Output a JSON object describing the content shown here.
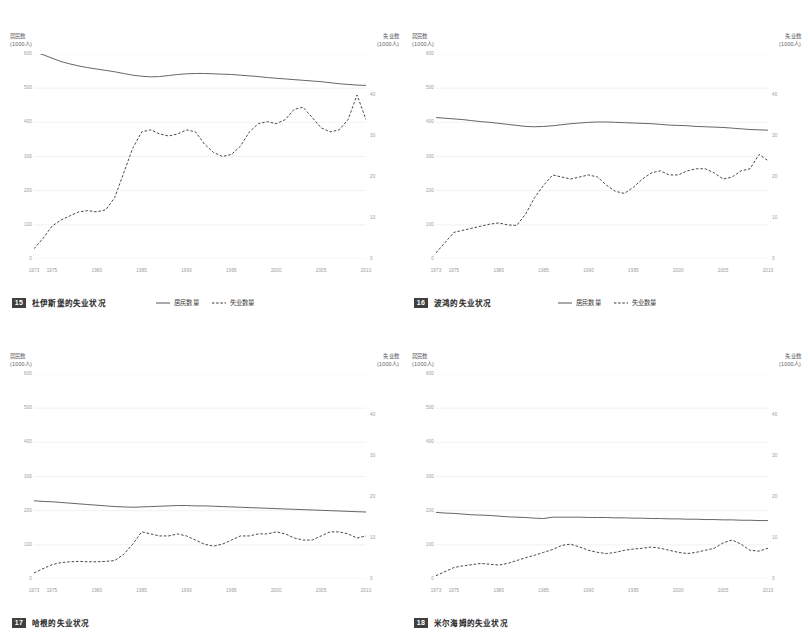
{
  "axes": {
    "left_title": "居民数",
    "left_unit": "(1000人)",
    "right_title": "失业数",
    "right_unit": "(1000人)",
    "left_ticks": [
      "600",
      "500",
      "400",
      "300",
      "200",
      "100",
      "0"
    ],
    "right_ticks": [
      "40",
      "30",
      "20",
      "10",
      "0"
    ],
    "x_ticks": [
      "1973",
      "1975",
      "1980",
      "1985",
      "1990",
      "1995",
      "2000",
      "2005",
      "2010"
    ]
  },
  "legend": {
    "items": [
      {
        "label": "居民数量",
        "style": "solid",
        "color": "#555555"
      },
      {
        "label": "失业数量",
        "style": "dashed",
        "color": "#333333"
      }
    ]
  },
  "colors": {
    "residents_line": "#555555",
    "unemployed_line": "#333333",
    "gridline": "#ececec",
    "tick_text": "#9a9a9a",
    "badge_bg": "#3f3f3f"
  },
  "panels": [
    {
      "number": "15",
      "title": "杜伊斯堡的失业状况"
    },
    {
      "number": "16",
      "title": "波鸿的失业状况"
    },
    {
      "number": "17",
      "title": "哈根的失业状况"
    },
    {
      "number": "18",
      "title": "米尔海姆的失业状况"
    }
  ],
  "chart_data": [
    {
      "type": "line",
      "title": "杜伊斯堡的失业状况",
      "number": "15",
      "xlabel": "",
      "ylabel": "居民数 (1000人)",
      "y2label": "失业数 (1000人)",
      "ylim": [
        0,
        600
      ],
      "y2lim": [
        0,
        50
      ],
      "xlim": [
        1973,
        2010
      ],
      "grid": true,
      "legend_position": "below-right",
      "x": [
        1973,
        1974,
        1975,
        1976,
        1977,
        1978,
        1979,
        1980,
        1981,
        1982,
        1983,
        1984,
        1985,
        1986,
        1987,
        1988,
        1989,
        1990,
        1991,
        1992,
        1993,
        1994,
        1995,
        1996,
        1997,
        1998,
        1999,
        2000,
        2001,
        2002,
        2003,
        2004,
        2005,
        2006,
        2007,
        2008,
        2009,
        2010
      ],
      "series": [
        {
          "name": "居民数量",
          "axis": "left",
          "style": "solid",
          "values": [
            607,
            598,
            588,
            578,
            571,
            565,
            560,
            556,
            552,
            548,
            543,
            538,
            535,
            533,
            534,
            537,
            540,
            542,
            543,
            543,
            542,
            541,
            540,
            538,
            536,
            534,
            531,
            529,
            527,
            525,
            523,
            521,
            519,
            516,
            513,
            511,
            509,
            508
          ]
        },
        {
          "name": "失业数量",
          "axis": "right",
          "style": "dashed",
          "values": [
            2.5,
            5,
            8,
            9.5,
            10.5,
            11.5,
            11.8,
            11.5,
            12,
            15,
            21,
            27,
            31,
            31.5,
            30.5,
            30,
            30.5,
            31.5,
            31,
            28,
            26,
            25,
            25.5,
            27.5,
            31,
            33,
            33.5,
            33,
            34,
            36.5,
            37,
            34.5,
            32,
            31,
            31.5,
            34,
            40,
            34,
            31,
            30,
            32,
            32
          ]
        }
      ]
    },
    {
      "type": "line",
      "title": "波鸿的失业状况",
      "number": "16",
      "xlabel": "",
      "ylabel": "居民数 (1000人)",
      "y2label": "失业数 (1000人)",
      "ylim": [
        0,
        600
      ],
      "y2lim": [
        0,
        50
      ],
      "xlim": [
        1973,
        2010
      ],
      "grid": true,
      "legend_position": "below-right",
      "x": [
        1973,
        1974,
        1975,
        1976,
        1977,
        1978,
        1979,
        1980,
        1981,
        1982,
        1983,
        1984,
        1985,
        1986,
        1987,
        1988,
        1989,
        1990,
        1991,
        1992,
        1993,
        1994,
        1995,
        1996,
        1997,
        1998,
        1999,
        2000,
        2001,
        2002,
        2003,
        2004,
        2005,
        2006,
        2007,
        2008,
        2009,
        2010
      ],
      "series": [
        {
          "name": "居民数量",
          "axis": "left",
          "style": "solid",
          "values": [
            414,
            412,
            410,
            408,
            405,
            402,
            400,
            397,
            394,
            391,
            388,
            387,
            388,
            390,
            393,
            396,
            398,
            400,
            401,
            401,
            400,
            399,
            398,
            397,
            396,
            394,
            392,
            391,
            390,
            388,
            387,
            386,
            385,
            383,
            381,
            379,
            378,
            377
          ]
        },
        {
          "name": "失业数量",
          "axis": "right",
          "style": "dashed",
          "values": [
            1.5,
            4,
            6.5,
            7,
            7.5,
            8,
            8.5,
            8.8,
            8.3,
            8.2,
            11,
            15,
            18,
            20.5,
            20,
            19.5,
            20,
            20.5,
            20,
            18,
            16.5,
            16,
            17.5,
            19.5,
            21,
            21.5,
            20.5,
            20.5,
            21.5,
            22,
            22,
            21,
            19.5,
            20,
            21.5,
            22,
            25.5,
            24,
            19,
            18.5,
            20.5,
            19
          ]
        }
      ]
    },
    {
      "type": "line",
      "title": "哈根的失业状况",
      "number": "17",
      "xlabel": "",
      "ylabel": "居民数 (1000人)",
      "y2label": "失业数 (1000人)",
      "ylim": [
        0,
        600
      ],
      "y2lim": [
        0,
        50
      ],
      "xlim": [
        1973,
        2010
      ],
      "grid": true,
      "legend_position": "none",
      "x": [
        1973,
        1974,
        1975,
        1976,
        1977,
        1978,
        1979,
        1980,
        1981,
        1982,
        1983,
        1984,
        1985,
        1986,
        1987,
        1988,
        1989,
        1990,
        1991,
        1992,
        1993,
        1994,
        1995,
        1996,
        1997,
        1998,
        1999,
        2000,
        2001,
        2002,
        2003,
        2004,
        2005,
        2006,
        2007,
        2008,
        2009,
        2010
      ],
      "series": [
        {
          "name": "居民数量",
          "axis": "left",
          "style": "solid",
          "values": [
            229,
            227,
            226,
            224,
            222,
            220,
            218,
            216,
            214,
            212,
            211,
            210,
            211,
            212,
            213,
            214,
            215,
            215,
            214,
            214,
            213,
            212,
            211,
            210,
            209,
            208,
            207,
            206,
            205,
            204,
            203,
            202,
            201,
            200,
            199,
            198,
            197,
            196
          ]
        },
        {
          "name": "失业数量",
          "axis": "right",
          "style": "dashed",
          "values": [
            1.5,
            2.5,
            3.5,
            4,
            4.2,
            4.3,
            4.2,
            4.2,
            4.3,
            4.5,
            6,
            8.5,
            11.5,
            11,
            10.5,
            10.5,
            11,
            10.5,
            9.5,
            8.5,
            8,
            8.5,
            9.5,
            10.5,
            10.5,
            11,
            11,
            11.5,
            11,
            10,
            9.5,
            9.5,
            10.5,
            11.5,
            11.5,
            11,
            10,
            10.5,
            11,
            10.5
          ]
        }
      ]
    },
    {
      "type": "line",
      "title": "米尔海姆的失业状况",
      "number": "18",
      "xlabel": "",
      "ylabel": "居民数 (1000人)",
      "y2label": "失业数 (1000人)",
      "ylim": [
        0,
        600
      ],
      "y2lim": [
        0,
        50
      ],
      "xlim": [
        1973,
        2010
      ],
      "grid": true,
      "legend_position": "none",
      "x": [
        1973,
        1974,
        1975,
        1976,
        1977,
        1978,
        1979,
        1980,
        1981,
        1982,
        1983,
        1984,
        1985,
        1986,
        1987,
        1988,
        1989,
        1990,
        1991,
        1992,
        1993,
        1994,
        1995,
        1996,
        1997,
        1998,
        1999,
        2000,
        2001,
        2002,
        2003,
        2004,
        2005,
        2006,
        2007,
        2008,
        2009,
        2010
      ],
      "series": [
        {
          "name": "居民数量",
          "axis": "left",
          "style": "solid",
          "values": [
            195,
            193,
            192,
            190,
            188,
            187,
            186,
            184,
            182,
            181,
            180,
            178,
            177,
            181,
            181,
            181,
            181,
            180,
            180,
            180,
            179,
            179,
            178,
            178,
            177,
            177,
            176,
            176,
            175,
            175,
            174,
            174,
            173,
            173,
            172,
            172,
            171,
            171
          ]
        },
        {
          "name": "失业数量",
          "axis": "right",
          "style": "dashed",
          "values": [
            0.8,
            1.8,
            2.8,
            3.2,
            3.5,
            3.8,
            3.6,
            3.4,
            3.8,
            4.5,
            5.2,
            5.8,
            6.5,
            7.2,
            8.2,
            8.5,
            7.8,
            7,
            6.5,
            6.2,
            6.5,
            7,
            7.3,
            7.5,
            7.8,
            7.5,
            7,
            6.5,
            6.2,
            6.5,
            7,
            7.5,
            8.8,
            9.5,
            8.5,
            7,
            6.8,
            7.5,
            8.2
          ]
        }
      ]
    }
  ]
}
